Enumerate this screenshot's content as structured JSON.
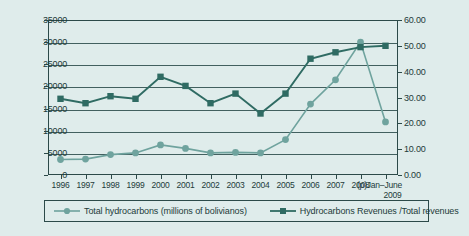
{
  "chart_data": {
    "type": "line",
    "title": "",
    "xlabel": "",
    "categories": [
      "1996",
      "1997",
      "1998",
      "1999",
      "2000",
      "2001",
      "2002",
      "2003",
      "2004",
      "2005",
      "2006",
      "2007",
      "2008",
      "(p)Jan–June 2009"
    ],
    "grid": true,
    "legend_position": "bottom",
    "axes": {
      "left": {
        "label": "Total hydrocarbons (millions of bolivianos)",
        "min": 0,
        "max": 35000,
        "step": 5000,
        "ticks": [
          "0",
          "5000",
          "10000",
          "15000",
          "20000",
          "25000",
          "30000",
          "35000"
        ]
      },
      "right": {
        "label": "Hydrocarbons Revenues /Total revenues",
        "min": 0,
        "max": 60,
        "step": 10,
        "ticks": [
          "0.00",
          "10.00",
          "20.00",
          "30.00",
          "40.00",
          "50.00",
          "60.00"
        ]
      }
    },
    "series": [
      {
        "name": "Total hydrocarbons (millions of bolivianos)",
        "axis": "left",
        "color": "#6fa39e",
        "marker": "circle",
        "values": [
          3500,
          3600,
          4600,
          5000,
          6800,
          6000,
          5000,
          5100,
          5000,
          8000,
          16000,
          21500,
          30000,
          12000
        ]
      },
      {
        "name": "Hydrocarbons Revenues /Total revenues",
        "axis": "right",
        "color": "#2f6b63",
        "marker": "square",
        "values": [
          29.5,
          27.8,
          30.5,
          29.5,
          38.0,
          34.5,
          27.8,
          31.5,
          23.8,
          31.5,
          45.0,
          47.5,
          49.5,
          50.0
        ]
      }
    ],
    "legend": [
      "Total hydrocarbons (millions of bolivianos)",
      "Hydrocarbons Revenues /Total revenues"
    ]
  }
}
